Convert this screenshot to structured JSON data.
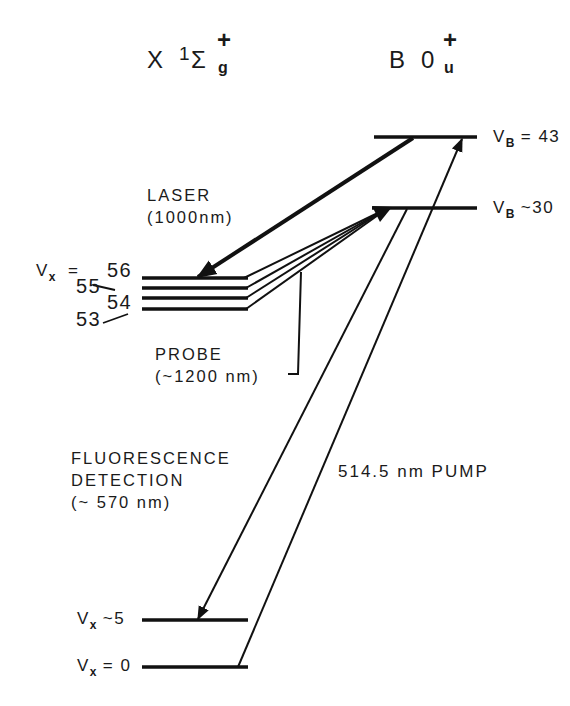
{
  "states": {
    "ground": {
      "main": "X",
      "sup_left": "1",
      "symbol": "Σ",
      "sub": "g",
      "sup": "+"
    },
    "excited": {
      "main": "B",
      "symbol": "0",
      "sub": "u",
      "sup": "+"
    }
  },
  "levels": {
    "vb43": {
      "var": "V",
      "sub": "B",
      "rel": "= 43"
    },
    "vb30": {
      "var": "V",
      "sub": "B",
      "rel": "~30"
    },
    "vx_prefix": {
      "var": "V",
      "sub": "x",
      "rel": "="
    },
    "vx56": "56",
    "vx55": "55",
    "vx54": "54",
    "vx53": "53",
    "vx5": {
      "var": "V",
      "sub": "x",
      "rel": "~5"
    },
    "vx0": {
      "var": "V",
      "sub": "x",
      "rel": "= 0"
    }
  },
  "annotations": {
    "laser": {
      "line1": "LASER",
      "line2": "(1000nm)"
    },
    "probe": {
      "line1": "PROBE",
      "line2": "(~1200 nm)"
    },
    "fluorescence": {
      "line1": "FLUORESCENCE",
      "line2": "DETECTION",
      "line3": "(~ 570 nm)"
    },
    "pump": "514.5 nm PUMP"
  },
  "colors": {
    "ink": "#111111",
    "background": "#ffffff"
  }
}
